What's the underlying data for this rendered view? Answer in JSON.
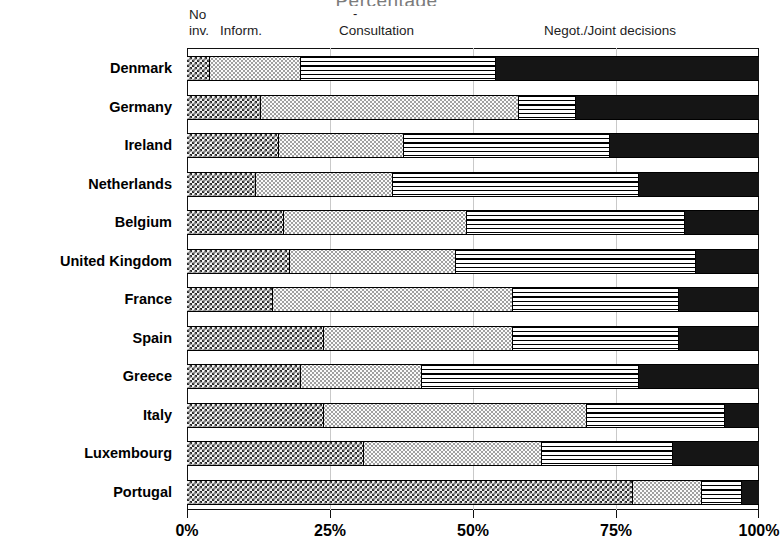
{
  "titles": {
    "cropped_top_left": "",
    "cropped_top_right": "Percentage"
  },
  "legend": {
    "no": "No",
    "inv": "inv.",
    "inform": "Inform.",
    "dash": "-",
    "consultation": "Consultation",
    "negotiation": "Negot./Joint decisions"
  },
  "axis": {
    "x_ticks": [
      "0%",
      "25%",
      "50%",
      "75%",
      "100%"
    ],
    "x_tick_values": [
      0,
      25,
      50,
      75,
      100
    ]
  },
  "chart_data": {
    "type": "bar",
    "orientation": "horizontal",
    "stacked": true,
    "title": "Percentage",
    "xlabel": "Percentage",
    "ylabel": "",
    "xlim": [
      0,
      100
    ],
    "grid": true,
    "legend_position": "top",
    "categories": [
      "Denmark",
      "Germany",
      "Ireland",
      "Netherlands",
      "Belgium",
      "United Kingdom",
      "France",
      "Spain",
      "Greece",
      "Italy",
      "Luxembourg",
      "Portugal"
    ],
    "series": [
      {
        "name": "No inv.",
        "pattern": "checkerboard-dark",
        "values": [
          4,
          13,
          16,
          12,
          17,
          18,
          15,
          24,
          20,
          24,
          31,
          78
        ]
      },
      {
        "name": "Inform.",
        "pattern": "fine-dots-light",
        "values": [
          16,
          45,
          22,
          24,
          32,
          29,
          42,
          33,
          21,
          46,
          31,
          12
        ]
      },
      {
        "name": "Consultation",
        "pattern": "horizontal-lines",
        "values": [
          34,
          10,
          36,
          43,
          38,
          42,
          29,
          29,
          38,
          24,
          23,
          7
        ]
      },
      {
        "name": "Negot./Joint decisions",
        "pattern": "solid-black",
        "values": [
          46,
          32,
          26,
          21,
          13,
          11,
          14,
          14,
          21,
          6,
          15,
          3
        ]
      }
    ]
  }
}
